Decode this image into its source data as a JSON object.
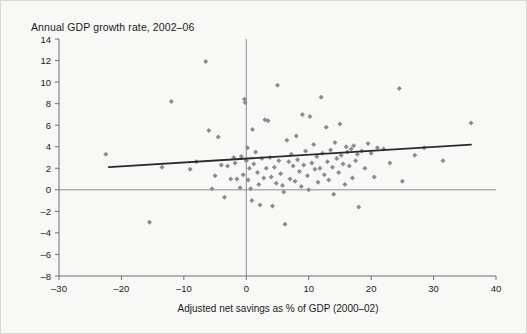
{
  "figure": {
    "title": "Annual GDP growth rate, 2002–06",
    "background_color": "#f8f8f7",
    "border_color": "#d8d8d6",
    "marker_color": "#8c8c8c",
    "trendline_color": "#2a2a2a",
    "axis_color": "#6f6f6f"
  },
  "chart_data": {
    "type": "scatter",
    "title": "Annual GDP growth rate, 2002–06",
    "xlabel": "Adjusted net savings as % of GDP (2000–02)",
    "ylabel": "Annual GDP growth rate, 2002–06",
    "xlim": [
      -30,
      40
    ],
    "ylim": [
      -8,
      14
    ],
    "xticks": [
      -30,
      -20,
      -10,
      0,
      10,
      20,
      30,
      40
    ],
    "xtick_labels": [
      "–30",
      "–20",
      "–10",
      "0",
      "10",
      "20",
      "30",
      "40"
    ],
    "yticks": [
      -8,
      -6,
      -4,
      -2,
      0,
      2,
      4,
      6,
      8,
      10,
      12,
      14
    ],
    "ytick_labels": [
      "–8",
      "–6",
      "–4",
      "–2",
      "0",
      "2",
      "4",
      "6",
      "8",
      "10",
      "12",
      "14"
    ],
    "grid": false,
    "legend": null,
    "reference_lines": [
      {
        "name": "y-zero",
        "orientation": "horizontal",
        "value": 0
      },
      {
        "name": "x-zero",
        "orientation": "vertical",
        "value": 0
      }
    ],
    "trendline": {
      "type": "linear-fit",
      "x_start": -22.0,
      "y_start": 2.1,
      "x_end": 36.0,
      "y_end": 4.2
    },
    "series": [
      {
        "name": "Countries",
        "marker": "diamond",
        "color": "#8c8c8c",
        "points": [
          [
            -22.5,
            3.3
          ],
          [
            -15.5,
            -3.0
          ],
          [
            -13.5,
            2.1
          ],
          [
            -12.0,
            8.2
          ],
          [
            -9.0,
            1.9
          ],
          [
            -8.0,
            2.6
          ],
          [
            -6.5,
            11.9
          ],
          [
            -6.0,
            5.5
          ],
          [
            -5.5,
            0.1
          ],
          [
            -5.0,
            1.3
          ],
          [
            -4.5,
            4.9
          ],
          [
            -4.0,
            2.3
          ],
          [
            -3.5,
            -0.7
          ],
          [
            -3.0,
            2.2
          ],
          [
            -2.5,
            1.0
          ],
          [
            -2.0,
            3.0
          ],
          [
            -1.8,
            2.5
          ],
          [
            -1.5,
            1.0
          ],
          [
            -1.0,
            0.2
          ],
          [
            -0.8,
            3.1
          ],
          [
            -0.5,
            1.4
          ],
          [
            -0.3,
            8.4
          ],
          [
            -0.2,
            8.1
          ],
          [
            0.0,
            2.7
          ],
          [
            0.2,
            3.9
          ],
          [
            0.3,
            0.9
          ],
          [
            0.5,
            2.0
          ],
          [
            0.7,
            0.1
          ],
          [
            0.9,
            -1.0
          ],
          [
            1.0,
            5.6
          ],
          [
            1.2,
            2.4
          ],
          [
            1.5,
            3.5
          ],
          [
            1.8,
            1.6
          ],
          [
            2.0,
            0.5
          ],
          [
            2.2,
            -1.4
          ],
          [
            2.5,
            2.9
          ],
          [
            2.8,
            1.1
          ],
          [
            3.0,
            6.5
          ],
          [
            3.2,
            2.0
          ],
          [
            3.5,
            6.4
          ],
          [
            3.8,
            3.0
          ],
          [
            4.0,
            1.2
          ],
          [
            4.2,
            -1.5
          ],
          [
            4.5,
            2.1
          ],
          [
            4.8,
            0.6
          ],
          [
            5.0,
            9.7
          ],
          [
            5.2,
            2.7
          ],
          [
            5.5,
            1.5
          ],
          [
            5.8,
            0.4
          ],
          [
            6.0,
            -0.2
          ],
          [
            6.2,
            -3.2
          ],
          [
            6.5,
            4.6
          ],
          [
            6.8,
            2.6
          ],
          [
            7.0,
            1.0
          ],
          [
            7.2,
            3.3
          ],
          [
            7.5,
            2.2
          ],
          [
            7.8,
            0.8
          ],
          [
            8.0,
            5.0
          ],
          [
            8.2,
            2.8
          ],
          [
            8.5,
            1.7
          ],
          [
            8.8,
            0.3
          ],
          [
            9.0,
            7.0
          ],
          [
            9.2,
            2.3
          ],
          [
            9.5,
            3.6
          ],
          [
            9.8,
            1.3
          ],
          [
            10.0,
            0.0
          ],
          [
            10.2,
            6.8
          ],
          [
            10.5,
            2.5
          ],
          [
            10.8,
            4.2
          ],
          [
            11.0,
            1.9
          ],
          [
            11.3,
            3.1
          ],
          [
            11.5,
            0.7
          ],
          [
            11.8,
            2.0
          ],
          [
            12.0,
            8.6
          ],
          [
            12.2,
            3.4
          ],
          [
            12.5,
            1.4
          ],
          [
            12.8,
            5.8
          ],
          [
            13.0,
            2.6
          ],
          [
            13.2,
            0.9
          ],
          [
            13.5,
            3.7
          ],
          [
            13.8,
            2.1
          ],
          [
            14.0,
            -0.4
          ],
          [
            14.2,
            4.4
          ],
          [
            14.5,
            2.9
          ],
          [
            14.8,
            1.6
          ],
          [
            15.0,
            6.1
          ],
          [
            15.2,
            3.2
          ],
          [
            15.5,
            2.4
          ],
          [
            15.8,
            0.5
          ],
          [
            16.0,
            4.0
          ],
          [
            16.2,
            3.5
          ],
          [
            16.5,
            2.2
          ],
          [
            16.8,
            3.8
          ],
          [
            17.0,
            1.1
          ],
          [
            17.2,
            4.1
          ],
          [
            17.5,
            2.7
          ],
          [
            17.8,
            3.3
          ],
          [
            18.0,
            -1.6
          ],
          [
            18.5,
            3.6
          ],
          [
            19.0,
            2.0
          ],
          [
            19.5,
            4.3
          ],
          [
            20.0,
            3.4
          ],
          [
            20.5,
            1.2
          ],
          [
            21.0,
            3.9
          ],
          [
            22.0,
            3.8
          ],
          [
            23.0,
            2.5
          ],
          [
            24.5,
            9.4
          ],
          [
            25.0,
            0.8
          ],
          [
            27.0,
            3.2
          ],
          [
            28.5,
            3.9
          ],
          [
            31.5,
            2.7
          ],
          [
            36.0,
            6.2
          ]
        ]
      }
    ]
  }
}
